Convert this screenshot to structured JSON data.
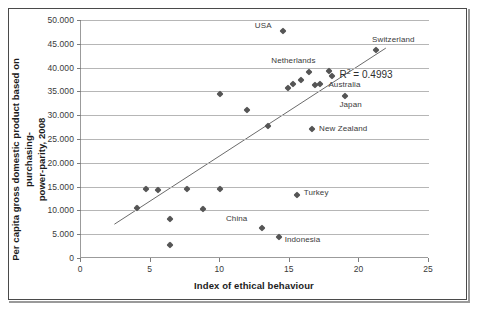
{
  "chart_data": {
    "type": "scatter",
    "title": "",
    "xlabel": "Index of ethical behaviour",
    "ylabel": "Per capita gross domestic product based on purchasing-power-parity, 2008",
    "ylabel_line1": "Per capita gross domestic product based on purchasing-",
    "ylabel_line2": "power-parity, 2008",
    "xlim": [
      0,
      25
    ],
    "ylim": [
      0,
      50000
    ],
    "xticks": [
      "0",
      "5",
      "10",
      "15",
      "20",
      "25"
    ],
    "xtick_values": [
      0,
      5,
      10,
      15,
      20,
      25
    ],
    "yticks": [
      "0",
      "5.000",
      "10.000",
      "15.000",
      "20.000",
      "25.000",
      "30.000",
      "35.000",
      "40.000",
      "45.000",
      "50.000"
    ],
    "ytick_values": [
      0,
      5000,
      10000,
      15000,
      20000,
      25000,
      30000,
      35000,
      40000,
      45000,
      50000
    ],
    "grid": "horizontal",
    "legend": "none",
    "annotations": [
      {
        "text": "R² = 0.4993",
        "base": "R",
        "sup": "2",
        "rest": " = 0.4993",
        "x": 21.8,
        "y": 38600
      }
    ],
    "trendline": {
      "type": "linear",
      "x_start": 2.4,
      "y_start": 7100,
      "x_end": 21.9,
      "y_end": 44100,
      "r_squared": 0.4993
    },
    "points": [
      {
        "label": "",
        "x": 4.0,
        "y": 10500
      },
      {
        "label": "",
        "x": 4.7,
        "y": 14600
      },
      {
        "label": "",
        "x": 5.5,
        "y": 14200
      },
      {
        "label": "",
        "x": 6.4,
        "y": 8200
      },
      {
        "label": "",
        "x": 6.4,
        "y": 2800
      },
      {
        "label": "",
        "x": 7.6,
        "y": 14600
      },
      {
        "label": "",
        "x": 8.8,
        "y": 10200
      },
      {
        "label": "",
        "x": 10.0,
        "y": 14500
      },
      {
        "label": "",
        "x": 10.0,
        "y": 34500
      },
      {
        "label": "",
        "x": 11.9,
        "y": 31000
      },
      {
        "label": "China",
        "x": 13.0,
        "y": 6300,
        "label_dx": -36,
        "label_dy": -9
      },
      {
        "label": "",
        "x": 13.4,
        "y": 27800
      },
      {
        "label": "Indonesia",
        "x": 14.2,
        "y": 4400,
        "label_dx": 6,
        "label_dy": 3
      },
      {
        "label": "USA",
        "x": 14.5,
        "y": 47700,
        "label_dx": -28,
        "label_dy": -5
      },
      {
        "label": "",
        "x": 14.9,
        "y": 35800
      },
      {
        "label": "",
        "x": 15.2,
        "y": 36500
      },
      {
        "label": "Turkey",
        "x": 15.5,
        "y": 13300,
        "label_dx": 7,
        "label_dy": -2
      },
      {
        "label": "",
        "x": 15.8,
        "y": 37500
      },
      {
        "label": "Netherlands",
        "x": 16.4,
        "y": 39000,
        "label_dx": -38,
        "label_dy": -11
      },
      {
        "label": "New Zealand",
        "x": 16.6,
        "y": 27000,
        "label_dx": 7,
        "label_dy": 0
      },
      {
        "label": "",
        "x": 16.8,
        "y": 36400
      },
      {
        "label": "Australia",
        "x": 17.2,
        "y": 36500,
        "label_dx": 8,
        "label_dy": 1
      },
      {
        "label": "",
        "x": 17.8,
        "y": 39300
      },
      {
        "label": "",
        "x": 18.0,
        "y": 38200
      },
      {
        "label": "Japan",
        "x": 19.0,
        "y": 34000,
        "label_dx": -6,
        "label_dy": 9
      },
      {
        "label": "Switzerland",
        "x": 21.2,
        "y": 43600,
        "label_dx": -4,
        "label_dy": -10
      }
    ]
  }
}
